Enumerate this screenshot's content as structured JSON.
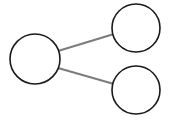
{
  "canvas": {
    "width": 169,
    "height": 120,
    "background_color": "#ffffff"
  },
  "diagram": {
    "type": "node-link-graph",
    "title": "",
    "node_fill_color": "#ffffff",
    "node_stroke_color": "#1a1a1a",
    "node_stroke_width": 1.6,
    "edge_color": "#7c7c7c",
    "edge_width": 2.2,
    "nodes": [
      {
        "id": "root",
        "label": "",
        "cx": 35,
        "cy": 59,
        "r": 25
      },
      {
        "id": "child-top",
        "label": "",
        "cx": 136,
        "cy": 28,
        "r": 24
      },
      {
        "id": "child-bottom",
        "label": "",
        "cx": 136,
        "cy": 90,
        "r": 24
      }
    ],
    "edges": [
      {
        "id": "edge-root-top",
        "from": "root",
        "to": "child-top",
        "x1": 58,
        "y1": 51,
        "x2": 114,
        "y2": 34
      },
      {
        "id": "edge-root-bottom",
        "from": "root",
        "to": "child-bottom",
        "x1": 58,
        "y1": 68,
        "x2": 114,
        "y2": 84
      }
    ]
  }
}
